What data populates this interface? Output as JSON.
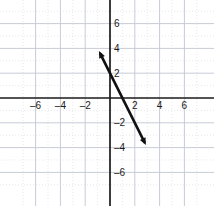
{
  "chart_data": {
    "type": "line",
    "title": "",
    "xlabel": "",
    "ylabel": "",
    "xlim": [
      -7.6,
      7.6
    ],
    "ylim": [
      -7.2,
      7.2
    ],
    "grid": true,
    "major_grid_step": 2,
    "minor_grid_step": 1,
    "legend": "none",
    "x_tick_labels": [
      "–6",
      "–4",
      "–2",
      "2",
      "4",
      "6"
    ],
    "x_tick_values": [
      -6,
      -4,
      -2,
      2,
      4,
      6
    ],
    "y_tick_labels": [
      "6",
      "4",
      "2",
      "–2",
      "–4",
      "–6"
    ],
    "y_tick_values": [
      6,
      4,
      2,
      -2,
      -4,
      -6
    ],
    "series": [
      {
        "name": "line-segment",
        "x": [
          -1,
          3
        ],
        "y": [
          4,
          -4
        ],
        "slope": -2,
        "y_intercept": 2,
        "x_intercept": 1,
        "arrow_start": true,
        "arrow_end": true,
        "color": "#111111",
        "width": 2.6
      }
    ]
  },
  "colors": {
    "background": "#ffffff",
    "axis": "#1a1a1a",
    "major_grid": "#c9ccd6",
    "minor_grid": "#dcdee6",
    "line": "#111111",
    "tick_text": "#1a1a1a"
  },
  "geometry": {
    "origin_x": 110,
    "origin_y": 98,
    "unit_px": 12.4
  }
}
